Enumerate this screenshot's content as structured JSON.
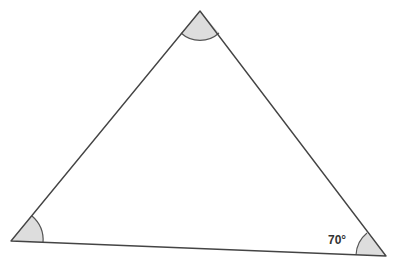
{
  "diagram": {
    "type": "triangle",
    "vertices": {
      "top": {
        "x": 200,
        "y": 11
      },
      "left": {
        "x": 11,
        "y": 241
      },
      "right": {
        "x": 386,
        "y": 256
      }
    },
    "angles": {
      "top": {
        "marked": true,
        "label": ""
      },
      "left": {
        "marked": true,
        "label": ""
      },
      "right": {
        "marked": true,
        "label": "70°"
      }
    },
    "colors": {
      "stroke": "#444444",
      "angle_fill": "#dddddd",
      "background": "#ffffff"
    }
  }
}
